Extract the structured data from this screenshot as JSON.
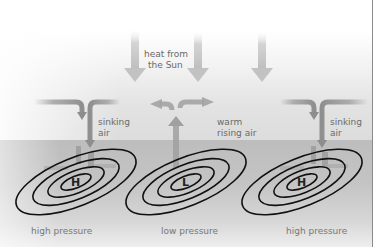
{
  "diagram": {
    "sun_label": {
      "line1": "heat from",
      "line2": "the Sun"
    },
    "cells": [
      {
        "air_label": {
          "line1": "sinking",
          "line2": "air"
        },
        "center_letter": "H",
        "pressure_label": "high pressure"
      },
      {
        "air_label": {
          "line1": "warm",
          "line2": "rising air"
        },
        "center_letter": "L",
        "pressure_label": "low pressure"
      },
      {
        "air_label": {
          "line1": "sinking",
          "line2": "air"
        },
        "center_letter": "H",
        "pressure_label": "high pressure"
      }
    ],
    "colors": {
      "arrow": "#9e9e9e",
      "sun_arrow": "#c4c4c4",
      "isobar": "#111111",
      "ground": "#bdbdbd",
      "label_text": "#6a6a6a"
    },
    "icons": {
      "sun_heat_arrows": "down-arrow-icon",
      "sinking_air": "down-arrow-icon",
      "rising_air": "up-arrow-icon",
      "isobars": "concentric-ellipses"
    }
  }
}
